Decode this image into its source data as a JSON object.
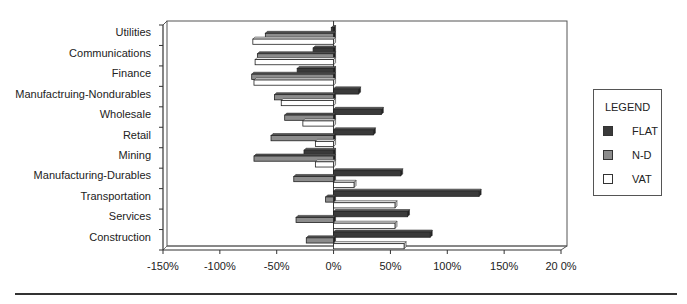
{
  "chart_data": {
    "type": "bar",
    "orientation": "horizontal",
    "title": "",
    "xlabel": "",
    "ylabel": "",
    "xlim": [
      -150,
      200
    ],
    "x_ticks": [
      -150,
      -100,
      -50,
      0,
      50,
      100,
      150,
      200
    ],
    "x_tick_labels": [
      "-150%",
      "-100%",
      "-50%",
      "0%",
      "50%",
      "100%",
      "150%",
      "20 0%"
    ],
    "grid": false,
    "legend_position": "right",
    "categories": [
      "Utilities",
      "Communications",
      "Finance",
      "Manufactruing-Nondurables",
      "Wholesale",
      "Retail",
      "Mining",
      "Manufacturing-Durables",
      "Transportation",
      "Services",
      "Construction"
    ],
    "series": [
      {
        "name": "FLAT",
        "color": "#3a3a3a",
        "values": [
          -2,
          -18,
          -32,
          22,
          42,
          35,
          -26,
          59,
          128,
          65,
          85
        ]
      },
      {
        "name": "N-D",
        "color": "#8c8c8c",
        "values": [
          -60,
          -67,
          -72,
          -52,
          -43,
          -55,
          -70,
          -35,
          -7,
          -33,
          -24
        ]
      },
      {
        "name": "VAT",
        "color": "#ffffff",
        "values": [
          -71,
          -69,
          -70,
          -46,
          -27,
          -16,
          -16,
          18,
          54,
          54,
          62
        ]
      }
    ]
  },
  "legend": {
    "title": "LEGEND",
    "items": [
      {
        "label": "FLAT",
        "color": "#3a3a3a"
      },
      {
        "label": "N-D",
        "color": "#8c8c8c"
      },
      {
        "label": "VAT",
        "color": "#ffffff"
      }
    ]
  }
}
